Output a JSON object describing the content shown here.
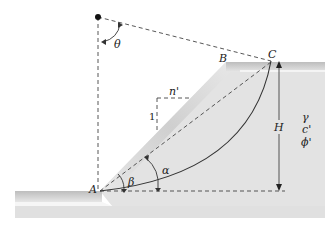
{
  "diagram": {
    "points": {
      "A": "A",
      "B": "B",
      "C": "C"
    },
    "angles": {
      "theta": "θ",
      "beta": "β",
      "alpha": "α"
    },
    "slope_ratio": {
      "vertical": "1",
      "horizontal": "n'"
    },
    "height_label": "H",
    "soil_properties": {
      "unit_weight": "γ",
      "cohesion": "c'",
      "friction_angle": "ϕ'"
    },
    "colors": {
      "soil_fill": "#dcdcdc",
      "soil_light": "#ececec",
      "line": "#333333",
      "dashed": "#444444"
    }
  }
}
